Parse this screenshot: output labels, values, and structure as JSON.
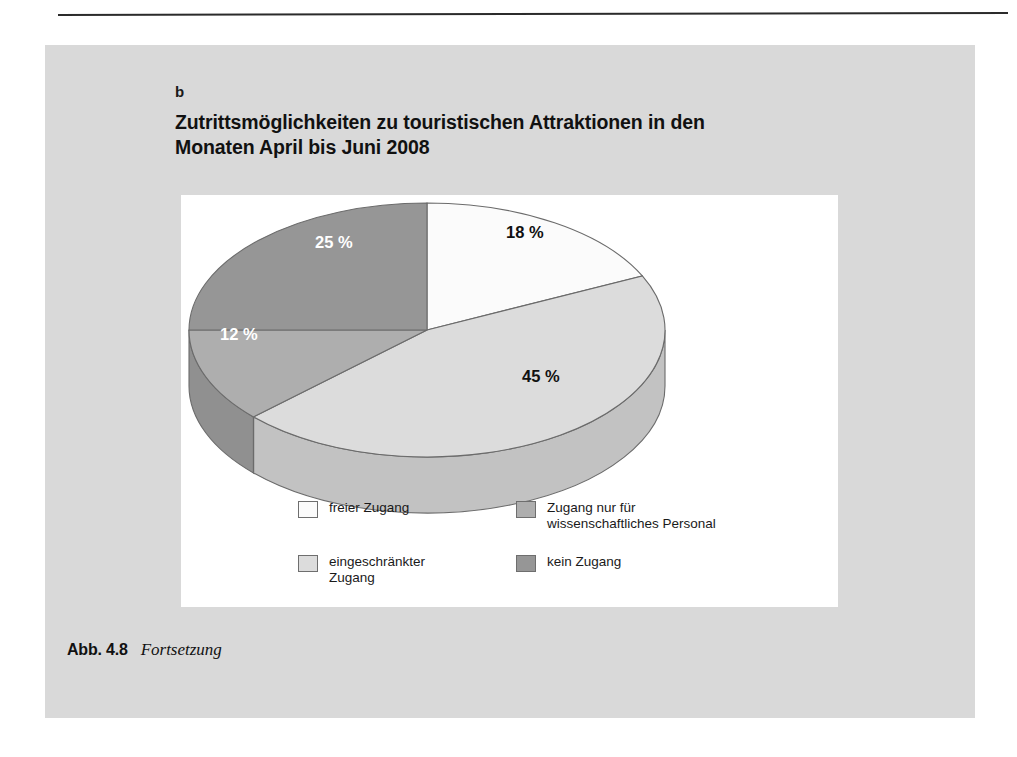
{
  "page": {
    "background_color": "#ffffff",
    "panel_color": "#d9d9d9",
    "rule_color": "#2b2b2b"
  },
  "figure": {
    "part_letter": "b",
    "title_line_1": "Zutrittsmöglichkeiten zu touristischen Attraktionen in den",
    "title_line_2": "Monaten April bis Juni 2008",
    "caption_label": "Abb. 4.8",
    "caption_text": "Fortsetzung"
  },
  "chart_data": {
    "type": "pie",
    "title": "Zutrittsmöglichkeiten zu touristischen Attraktionen in den Monaten April bis Juni 2008",
    "three_d": true,
    "start_angle_deg": 0,
    "direction": "clockwise",
    "unit": "%",
    "categories": [
      "freier Zugang",
      "eingeschränkter Zugang",
      "Zugang nur für wissenschaftliches Personal",
      "kein Zugang"
    ],
    "values": [
      18,
      45,
      12,
      25
    ],
    "data_labels": [
      "18 %",
      "45 %",
      "12 %",
      "25 %"
    ],
    "colors": [
      "#fbfbfb",
      "#dcdcdc",
      "#aeaeae",
      "#969696"
    ],
    "side_colors": [
      "#d2d2d2",
      "#c2c2c2",
      "#909090",
      "#7d7d7d"
    ],
    "label_colors": [
      "#111111",
      "#111111",
      "#ffffff",
      "#ffffff"
    ],
    "legend_position": "bottom",
    "xlabel": "",
    "ylabel": ""
  },
  "legend": {
    "items": [
      {
        "label": "freier Zugang",
        "color": "#fbfbfb"
      },
      {
        "label": "eingeschränkter\nZugang",
        "color": "#dcdcdc"
      },
      {
        "label": "Zugang nur für\nwissenschaftliches Personal",
        "color": "#aeaeae"
      },
      {
        "label": "kein Zugang",
        "color": "#969696"
      }
    ]
  },
  "labels": {
    "p0": "18 %",
    "p1": "45 %",
    "p2": "12 %",
    "p3": "25 %"
  }
}
